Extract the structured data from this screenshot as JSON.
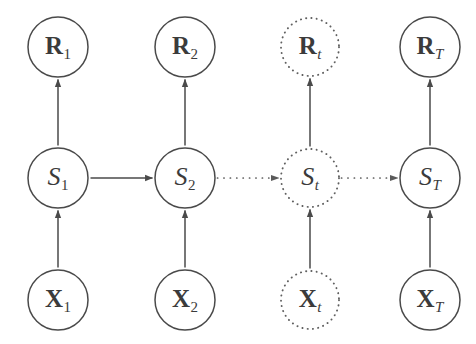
{
  "figure": {
    "background_color": "#ffffff",
    "stroke_color": "#4a4a4a",
    "text_color": "#3b3b3b"
  },
  "columns": [
    {
      "key": "t1",
      "index_label": "1",
      "index_style": "upright",
      "cx": 58,
      "style": "solid"
    },
    {
      "key": "t2",
      "index_label": "2",
      "index_style": "upright",
      "cx": 185,
      "style": "solid"
    },
    {
      "key": "tt",
      "index_label": "t",
      "index_style": "italic",
      "cx": 310,
      "style": "dotted"
    },
    {
      "key": "tT",
      "index_label": "T",
      "index_style": "italic",
      "cx": 430,
      "style": "solid"
    }
  ],
  "rows": [
    {
      "key": "reward",
      "symbol": "R",
      "symbol_style": "bold",
      "cy": 47
    },
    {
      "key": "state",
      "symbol": "S",
      "symbol_style": "italic",
      "cy": 178
    },
    {
      "key": "observation",
      "symbol": "X",
      "symbol_style": "bold",
      "cy": 300
    }
  ],
  "nodes": [
    {
      "id": "R1",
      "symbol": "R",
      "subscript": "1",
      "symbol_style": "bold",
      "sub_style": "upright",
      "cx": 58,
      "cy": 47,
      "r": 30,
      "border": "solid"
    },
    {
      "id": "R2",
      "symbol": "R",
      "subscript": "2",
      "symbol_style": "bold",
      "sub_style": "upright",
      "cx": 185,
      "cy": 47,
      "r": 30,
      "border": "solid"
    },
    {
      "id": "Rt",
      "symbol": "R",
      "subscript": "t",
      "symbol_style": "bold",
      "sub_style": "italic",
      "cx": 310,
      "cy": 47,
      "r": 29,
      "border": "dotted"
    },
    {
      "id": "RT",
      "symbol": "R",
      "subscript": "T",
      "symbol_style": "bold",
      "sub_style": "italic",
      "cx": 430,
      "cy": 47,
      "r": 30,
      "border": "solid"
    },
    {
      "id": "S1",
      "symbol": "S",
      "subscript": "1",
      "symbol_style": "italic",
      "sub_style": "upright",
      "cx": 58,
      "cy": 178,
      "r": 30,
      "border": "solid"
    },
    {
      "id": "S2",
      "symbol": "S",
      "subscript": "2",
      "symbol_style": "italic",
      "sub_style": "upright",
      "cx": 185,
      "cy": 178,
      "r": 30,
      "border": "solid"
    },
    {
      "id": "St",
      "symbol": "S",
      "subscript": "t",
      "symbol_style": "italic",
      "sub_style": "italic",
      "cx": 310,
      "cy": 178,
      "r": 29,
      "border": "dotted"
    },
    {
      "id": "ST",
      "symbol": "S",
      "subscript": "T",
      "symbol_style": "italic",
      "sub_style": "italic",
      "cx": 430,
      "cy": 178,
      "r": 30,
      "border": "solid"
    },
    {
      "id": "X1",
      "symbol": "X",
      "subscript": "1",
      "symbol_style": "bold",
      "sub_style": "upright",
      "cx": 58,
      "cy": 300,
      "r": 30,
      "border": "solid"
    },
    {
      "id": "X2",
      "symbol": "X",
      "subscript": "2",
      "symbol_style": "bold",
      "sub_style": "upright",
      "cx": 185,
      "cy": 300,
      "r": 30,
      "border": "solid"
    },
    {
      "id": "Xt",
      "symbol": "X",
      "subscript": "t",
      "symbol_style": "bold",
      "sub_style": "italic",
      "cx": 310,
      "cy": 300,
      "r": 29,
      "border": "dotted"
    },
    {
      "id": "XT",
      "symbol": "X",
      "subscript": "T",
      "symbol_style": "bold",
      "sub_style": "italic",
      "cx": 430,
      "cy": 300,
      "r": 30,
      "border": "solid"
    }
  ],
  "edges": [
    {
      "id": "S1-R1",
      "from": "S1",
      "to": "R1",
      "direction": "up",
      "style": "solid"
    },
    {
      "id": "S2-R2",
      "from": "S2",
      "to": "R2",
      "direction": "up",
      "style": "solid"
    },
    {
      "id": "St-Rt",
      "from": "St",
      "to": "Rt",
      "direction": "up",
      "style": "solid"
    },
    {
      "id": "ST-RT",
      "from": "ST",
      "to": "RT",
      "direction": "up",
      "style": "solid"
    },
    {
      "id": "X1-S1",
      "from": "X1",
      "to": "S1",
      "direction": "up",
      "style": "solid"
    },
    {
      "id": "X2-S2",
      "from": "X2",
      "to": "S2",
      "direction": "up",
      "style": "solid"
    },
    {
      "id": "Xt-St",
      "from": "Xt",
      "to": "St",
      "direction": "up",
      "style": "solid"
    },
    {
      "id": "XT-ST",
      "from": "XT",
      "to": "ST",
      "direction": "up",
      "style": "solid"
    },
    {
      "id": "S1-S2",
      "from": "S1",
      "to": "S2",
      "direction": "right",
      "style": "solid"
    },
    {
      "id": "S2-St",
      "from": "S2",
      "to": "St",
      "direction": "right",
      "style": "dotted"
    },
    {
      "id": "St-ST",
      "from": "St",
      "to": "ST",
      "direction": "right",
      "style": "dotted"
    }
  ]
}
